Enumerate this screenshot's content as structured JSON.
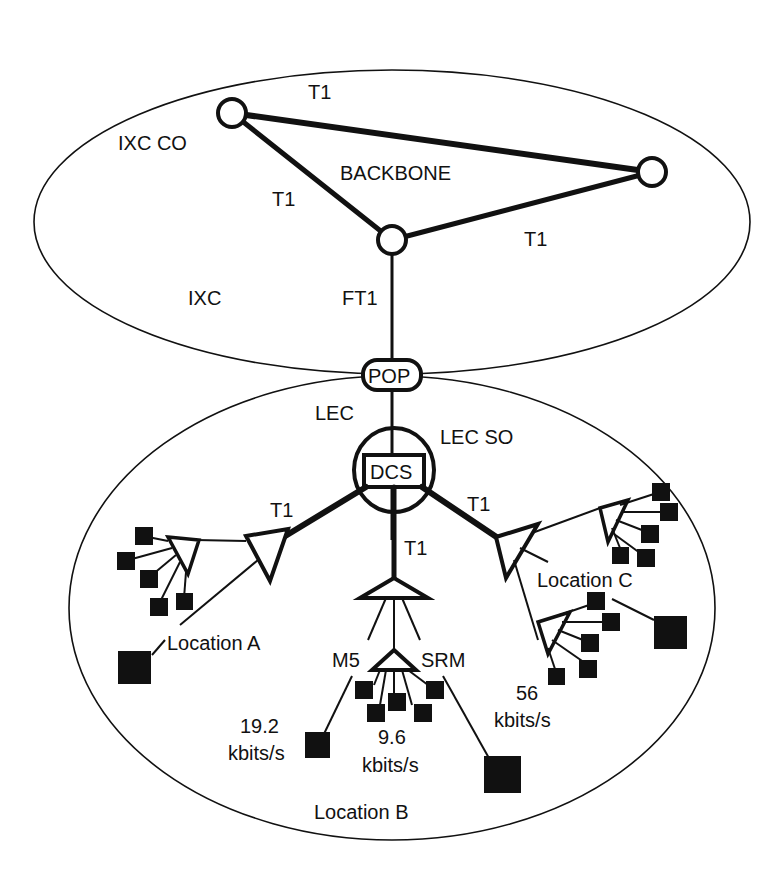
{
  "diagram": {
    "regions": {
      "ixc": "IXC",
      "lec": "LEC"
    },
    "backbone": {
      "title": "BACKBONE",
      "ixc_co": "IXC CO",
      "links": [
        "T1",
        "T1",
        "T1"
      ],
      "uplink": "FT1"
    },
    "pop": "POP",
    "lec_so": "LEC SO",
    "dcs": "DCS",
    "dcs_links": {
      "left": "T1",
      "center": "T1",
      "right": "T1"
    },
    "location_a": {
      "label": "Location A"
    },
    "location_b": {
      "label": "Location B",
      "mux_left": "M5",
      "mux_right": "SRM",
      "rate_left": [
        "19.2",
        "kbits/s"
      ],
      "rate_center": [
        "9.6",
        "kbits/s"
      ],
      "rate_right": [
        "56",
        "kbits/s"
      ]
    },
    "location_c": {
      "label": "Location C"
    },
    "colors": {
      "ink": "#111111",
      "background": "#ffffff"
    }
  }
}
